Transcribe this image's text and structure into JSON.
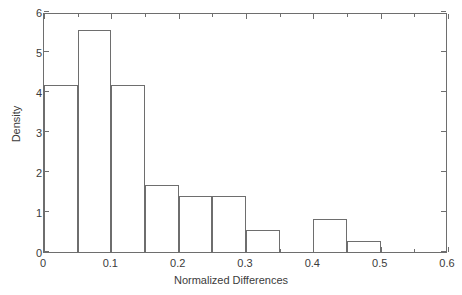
{
  "chart_data": {
    "type": "bar",
    "title": "",
    "subtitle": "",
    "xlabel": "Normalized Differences",
    "ylabel": "Density",
    "xlim": [
      0,
      0.6
    ],
    "ylim": [
      0,
      6
    ],
    "grid": false,
    "legend": null,
    "bin_width": 0.05,
    "bin_edges": [
      0.0,
      0.05,
      0.1,
      0.15,
      0.2,
      0.25,
      0.3,
      0.35,
      0.4,
      0.45,
      0.5,
      0.55,
      0.6
    ],
    "categories": [
      "0.00-0.05",
      "0.05-0.10",
      "0.10-0.15",
      "0.15-0.20",
      "0.20-0.25",
      "0.25-0.30",
      "0.30-0.35",
      "0.35-0.40",
      "0.40-0.45",
      "0.45-0.50",
      "0.50-0.55",
      "0.55-0.60"
    ],
    "values": [
      4.17,
      5.55,
      4.17,
      1.67,
      1.39,
      1.39,
      0.56,
      0,
      0.83,
      0.28,
      0,
      0
    ],
    "bars": [
      {
        "x0": 0.0,
        "x1": 0.05,
        "density": 4.17
      },
      {
        "x0": 0.05,
        "x1": 0.1,
        "density": 5.55
      },
      {
        "x0": 0.1,
        "x1": 0.15,
        "density": 4.17
      },
      {
        "x0": 0.15,
        "x1": 0.2,
        "density": 1.67
      },
      {
        "x0": 0.2,
        "x1": 0.25,
        "density": 1.39
      },
      {
        "x0": 0.25,
        "x1": 0.3,
        "density": 1.39
      },
      {
        "x0": 0.3,
        "x1": 0.35,
        "density": 0.56
      },
      {
        "x0": 0.35,
        "x1": 0.4,
        "density": 0
      },
      {
        "x0": 0.4,
        "x1": 0.45,
        "density": 0.83
      },
      {
        "x0": 0.45,
        "x1": 0.5,
        "density": 0.28
      },
      {
        "x0": 0.5,
        "x1": 0.55,
        "density": 0
      },
      {
        "x0": 0.55,
        "x1": 0.6,
        "density": 0
      }
    ],
    "xticks": [
      0,
      0.1,
      0.2,
      0.3,
      0.4,
      0.5,
      0.6
    ],
    "xtick_labels": [
      "0",
      "0.1",
      "0.2",
      "0.3",
      "0.4",
      "0.5",
      "0.6"
    ],
    "xticks_minor": [
      0.05,
      0.15,
      0.25,
      0.35,
      0.45,
      0.55
    ],
    "yticks": [
      0,
      1,
      2,
      3,
      4,
      5,
      6
    ],
    "ytick_labels": [
      "0",
      "1",
      "2",
      "3",
      "4",
      "5",
      "6"
    ],
    "colors": {
      "bar_edge": "#6e6e6e",
      "bar_fill": "transparent",
      "axis": "#6e6e6e",
      "text": "#3b3b3b",
      "background": "#ffffff"
    }
  }
}
